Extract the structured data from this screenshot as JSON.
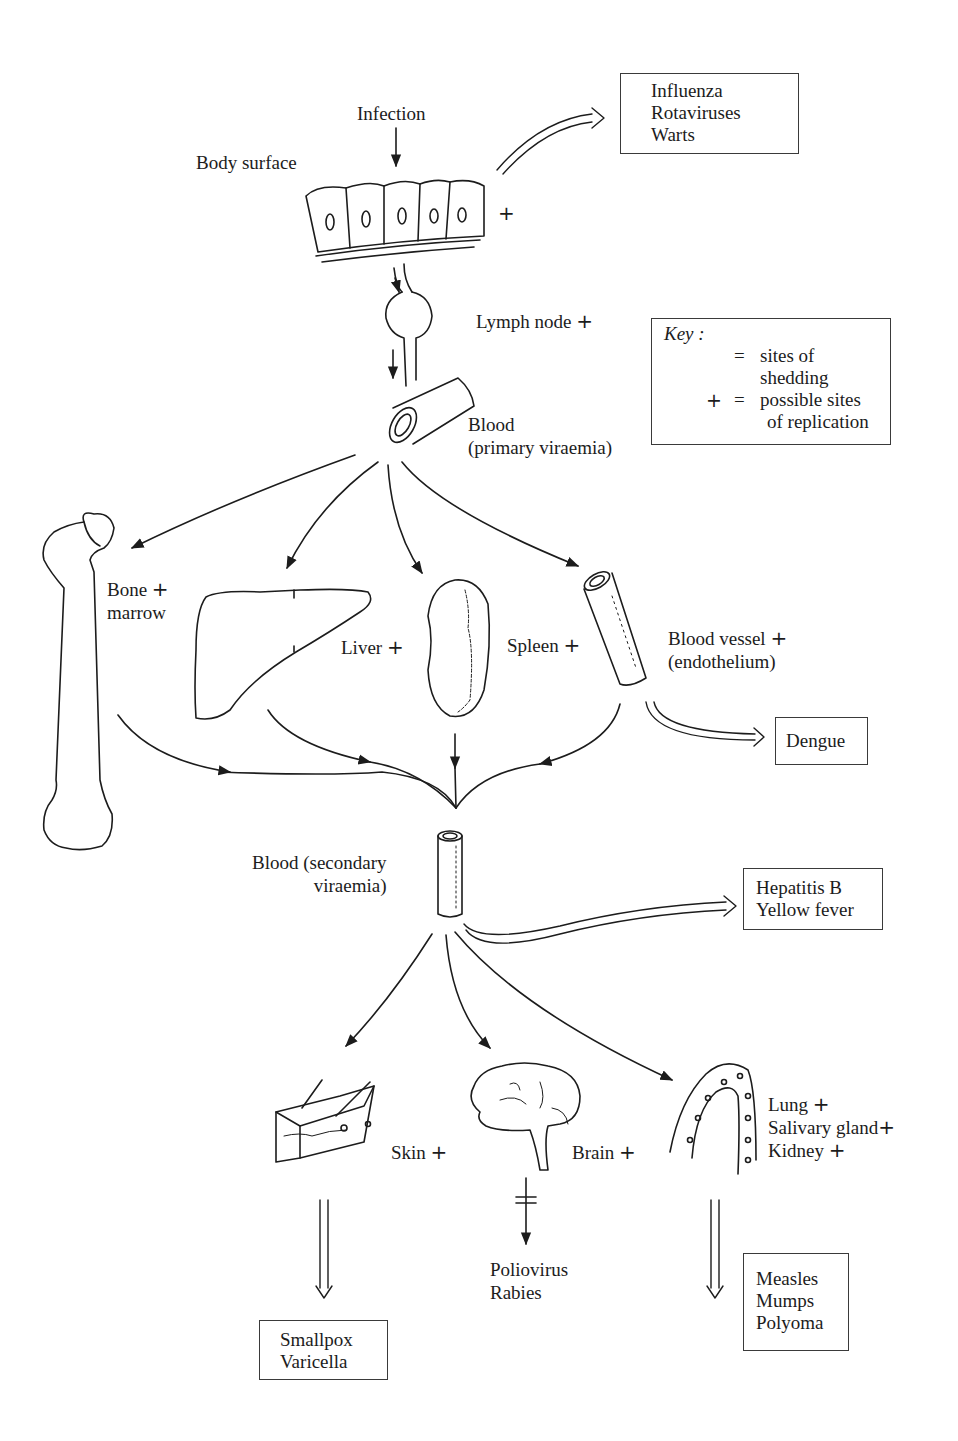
{
  "diagram": {
    "type": "flow-diagram",
    "colors": {
      "ink": "#1c1c1c",
      "background": "#ffffff"
    },
    "labels": {
      "infection": "Infection",
      "body_surface": "Body surface",
      "body_surface_plus": "+",
      "lymph_node": "Lymph node",
      "lymph_node_plus": "+",
      "blood_primary_line1": "Blood",
      "blood_primary_line2": "(primary viraemia)",
      "bone_marrow_line1": "Bone",
      "bone_marrow_line2": "marrow",
      "bone_marrow_plus": "+",
      "liver": "Liver",
      "liver_plus": "+",
      "spleen": "Spleen",
      "spleen_plus": "+",
      "blood_vessel_line1": "Blood vessel",
      "blood_vessel_line2": "(endothelium)",
      "blood_vessel_plus": "+",
      "blood_secondary_line1": "Blood (secondary",
      "blood_secondary_line2": "viraemia)",
      "skin": "Skin",
      "skin_plus": "+",
      "brain": "Brain",
      "brain_plus": "+",
      "lung": "Lung",
      "lung_plus": "+",
      "salivary_gland": "Salivary gland",
      "salivary_gland_plus": "+",
      "kidney": "Kidney",
      "kidney_plus": "+",
      "poliovirus": "Poliovirus",
      "rabies": "Rabies"
    },
    "shedding_boxes": {
      "surface": [
        "Influenza",
        "Rotaviruses",
        "Warts"
      ],
      "endothelium": [
        "Dengue"
      ],
      "blood": [
        "Hepatitis B",
        "Yellow fever"
      ],
      "skin": [
        "Smallpox",
        "Varicella"
      ],
      "glands": [
        "Measles",
        "Mumps",
        "Polyoma"
      ]
    },
    "key": {
      "title": "Key :",
      "shedding_symbol": "open-arrow",
      "shedding_eq": "=",
      "shedding_line1": "sites of",
      "shedding_line2": "shedding",
      "replication_symbol": "+",
      "replication_eq": "=",
      "replication_line1": "possible sites",
      "replication_line2": "of replication"
    },
    "nodes": [
      "Body surface",
      "Lymph node",
      "Blood (primary viraemia)",
      "Bone marrow",
      "Liver",
      "Spleen",
      "Blood vessel (endothelium)",
      "Blood (secondary viraemia)",
      "Skin",
      "Brain",
      "Lung",
      "Salivary gland",
      "Kidney"
    ],
    "edges": [
      [
        "Infection",
        "Body surface"
      ],
      [
        "Body surface",
        "Lymph node"
      ],
      [
        "Lymph node",
        "Blood (primary viraemia)"
      ],
      [
        "Blood (primary viraemia)",
        "Bone marrow"
      ],
      [
        "Blood (primary viraemia)",
        "Liver"
      ],
      [
        "Blood (primary viraemia)",
        "Spleen"
      ],
      [
        "Blood (primary viraemia)",
        "Blood vessel (endothelium)"
      ],
      [
        "Bone marrow",
        "Blood (secondary viraemia)"
      ],
      [
        "Liver",
        "Blood (secondary viraemia)"
      ],
      [
        "Spleen",
        "Blood (secondary viraemia)"
      ],
      [
        "Blood vessel (endothelium)",
        "Blood (secondary viraemia)"
      ],
      [
        "Blood (secondary viraemia)",
        "Skin"
      ],
      [
        "Blood (secondary viraemia)",
        "Brain"
      ],
      [
        "Blood (secondary viraemia)",
        "Lung / Salivary gland / Kidney"
      ],
      [
        "Brain",
        "Poliovirus, Rabies (blocked)"
      ]
    ]
  }
}
